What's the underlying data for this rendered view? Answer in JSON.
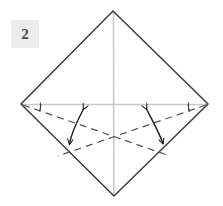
{
  "figure": {
    "step_label": "2",
    "canvas": {
      "width": 223,
      "height": 206
    },
    "background_color": "#ffffff",
    "colors": {
      "outline": "#3d3d3d",
      "crease_light": "#c9c9c9",
      "dashed_fold": "#555555",
      "arrow": "#1a1a1a",
      "badge_background": "#ececec",
      "badge_text": "#4a4a4a"
    },
    "shape": {
      "name": "diamond",
      "description": "square rotated 45 degrees",
      "vertices": {
        "top": [
          113,
          11
        ],
        "right": [
          208,
          104
        ],
        "bottom": [
          114,
          196
        ],
        "left": [
          21,
          104
        ]
      }
    },
    "creases": [
      {
        "name": "horizontal-center-crease",
        "from": [
          21,
          104
        ],
        "to": [
          208,
          104
        ],
        "style": "solid-light"
      },
      {
        "name": "vertical-center-crease",
        "from": [
          113,
          11
        ],
        "to": [
          114,
          196
        ],
        "style": "solid-light"
      }
    ],
    "fold_lines": [
      {
        "name": "left-dashed-fold",
        "from": [
          21,
          104
        ],
        "to": [
          170,
          156
        ],
        "style": "dashed"
      },
      {
        "name": "right-dashed-fold",
        "from": [
          208,
          104
        ],
        "to": [
          58,
          156
        ],
        "style": "dashed"
      }
    ],
    "angle_marks": [
      {
        "name": "left-angle-arc",
        "vertex": [
          21,
          104
        ]
      },
      {
        "name": "right-angle-arc",
        "vertex": [
          208,
          104
        ]
      }
    ],
    "arrows": [
      {
        "name": "left-fold-arrow",
        "type": "curved-double-headed",
        "head_upper": [
          84,
          107
        ],
        "head_lower": [
          68,
          147
        ]
      },
      {
        "name": "right-fold-arrow",
        "type": "curved-double-headed",
        "head_upper": [
          146,
          107
        ],
        "head_lower": [
          164,
          146
        ]
      }
    ]
  }
}
